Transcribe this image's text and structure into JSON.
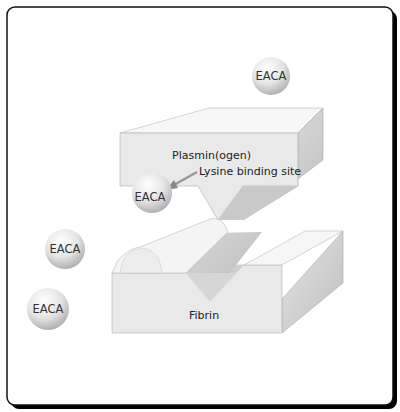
{
  "diagram": {
    "labels": {
      "plasminogen": "Plasmin(ogen)",
      "binding_site": "Lysine binding site",
      "fibrin": "Fibrin"
    },
    "molecules": [
      {
        "label": "EACA",
        "position": "free-top"
      },
      {
        "label": "EACA",
        "position": "bound"
      },
      {
        "label": "EACA",
        "position": "free-left-upper"
      },
      {
        "label": "EACA",
        "position": "free-left-lower"
      }
    ],
    "colors": {
      "border": "#111111",
      "block_front": "#e9e9e9",
      "block_top": "#f7f7f7",
      "block_side": "#cfcfcf",
      "sphere": "#dcdcdc"
    }
  }
}
